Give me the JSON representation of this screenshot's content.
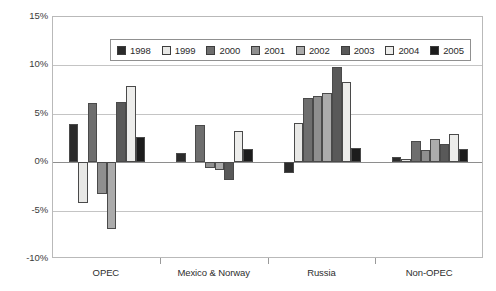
{
  "chart_data": {
    "type": "bar",
    "title": "",
    "subtitle": "",
    "xlabel": "",
    "ylabel": "",
    "categories": [
      "OPEC",
      "Mexico & Norway",
      "Russia",
      "Non-OPEC"
    ],
    "ylim": [
      -10,
      15
    ],
    "ytick_labels": [
      "15%",
      "10%",
      "5%",
      "0%",
      "-5%",
      "-10%"
    ],
    "ytick_values": [
      15,
      10,
      5,
      0,
      -5,
      -10
    ],
    "grid": true,
    "legend_position": "top-left-inside",
    "value_suffix": "%",
    "series": [
      {
        "name": "1998",
        "color": "#2b2b2b",
        "values": [
          3.9,
          1.0,
          -1.1,
          0.5
        ]
      },
      {
        "name": "1999",
        "color": "#e8e8e6",
        "values": [
          -4.2,
          0.0,
          4.0,
          0.3
        ]
      },
      {
        "name": "2000",
        "color": "#6e6e6e",
        "values": [
          6.1,
          3.8,
          6.6,
          2.2
        ]
      },
      {
        "name": "2001",
        "color": "#8f8f8f",
        "values": [
          -3.3,
          -0.6,
          6.8,
          1.3
        ]
      },
      {
        "name": "2002",
        "color": "#ababab",
        "values": [
          -6.9,
          -0.8,
          7.1,
          2.4
        ]
      },
      {
        "name": "2003",
        "color": "#595959",
        "values": [
          6.2,
          -1.8,
          9.8,
          1.9
        ]
      },
      {
        "name": "2004",
        "color": "#ededeb",
        "values": [
          7.9,
          3.2,
          8.3,
          2.9
        ]
      },
      {
        "name": "2005",
        "color": "#1c1c1c",
        "values": [
          2.6,
          1.4,
          1.5,
          1.4
        ]
      }
    ]
  },
  "legend": {
    "entries": [
      {
        "label": "1998"
      },
      {
        "label": "1999"
      },
      {
        "label": "2000"
      },
      {
        "label": "2001"
      },
      {
        "label": "2002"
      },
      {
        "label": "2003"
      },
      {
        "label": "2004"
      },
      {
        "label": "2005"
      }
    ]
  },
  "colors": {
    "plot_border": "#b9b9b9",
    "gridline": "#c4c4c4",
    "zero_line": "#8e8e8e",
    "bar_outline": "#4a4a4a",
    "text": "#2e2e2e",
    "background": "#ffffff"
  }
}
